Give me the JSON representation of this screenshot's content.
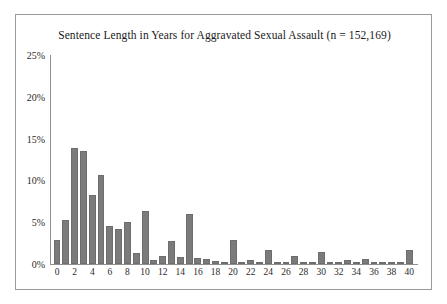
{
  "chart_data": {
    "type": "bar",
    "title": "Sentence Length in Years for Aggravated Sexual Assault (n = 152,169)",
    "xlabel": "",
    "ylabel": "",
    "ylim": [
      0,
      25
    ],
    "xlim": [
      -0.8,
      41
    ],
    "grid": false,
    "legend": null,
    "bar_color": "#7b7b7b",
    "y_ticks": [
      0,
      5,
      10,
      15,
      20,
      25
    ],
    "y_tick_labels": [
      "0%",
      "5%",
      "10%",
      "15%",
      "20%",
      "25%"
    ],
    "x_ticks": [
      0,
      2,
      4,
      6,
      8,
      10,
      12,
      14,
      16,
      18,
      20,
      22,
      24,
      26,
      28,
      30,
      32,
      34,
      36,
      38,
      40
    ],
    "x_tick_labels": [
      "0",
      "2",
      "4",
      "6",
      "8",
      "10",
      "12",
      "14",
      "16",
      "18",
      "20",
      "22",
      "24",
      "26",
      "28",
      "30",
      "32",
      "34",
      "36",
      "38",
      "40"
    ],
    "categories": [
      0,
      1,
      2,
      3,
      4,
      5,
      6,
      7,
      8,
      9,
      10,
      11,
      12,
      13,
      14,
      15,
      16,
      17,
      18,
      19,
      20,
      21,
      22,
      23,
      24,
      25,
      26,
      27,
      28,
      29,
      30,
      31,
      32,
      33,
      34,
      35,
      36,
      37,
      38,
      39,
      40
    ],
    "values": [
      2.9,
      5.3,
      13.9,
      13.5,
      8.2,
      10.6,
      4.6,
      4.2,
      5.0,
      1.3,
      6.4,
      0.5,
      1.0,
      2.8,
      0.8,
      6.0,
      0.7,
      0.6,
      0.4,
      0.2,
      2.9,
      0.15,
      0.5,
      0.3,
      1.7,
      0.1,
      0.1,
      0.9,
      0.05,
      0.05,
      1.4,
      0.05,
      0.05,
      0.5,
      0.05,
      0.6,
      0.05,
      0.05,
      0.05,
      0.05,
      1.7
    ]
  }
}
